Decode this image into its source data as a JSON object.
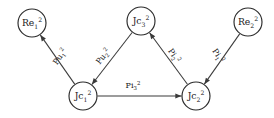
{
  "diagram": {
    "type": "directed-graph",
    "nodes": [
      {
        "id": "Re1",
        "base": "Re",
        "sub": "1",
        "sup": "2",
        "full": "Re₁²",
        "cx": 32,
        "cy": 23,
        "r": 14
      },
      {
        "id": "Jc3",
        "base": "Jc",
        "sub": "3",
        "sup": "2",
        "full": "Jc₃²",
        "cx": 141,
        "cy": 21,
        "r": 14
      },
      {
        "id": "Re2",
        "base": "Re",
        "sub": "2",
        "sup": "2",
        "full": "Re₂²",
        "cx": 248,
        "cy": 22,
        "r": 14
      },
      {
        "id": "Jc1",
        "base": "Jc",
        "sub": "1",
        "sup": "2",
        "full": "Jc₁²",
        "cx": 83,
        "cy": 96,
        "r": 14
      },
      {
        "id": "Jc2",
        "base": "Jc",
        "sub": "2",
        "sup": "2",
        "full": "Jc₂²",
        "cx": 196,
        "cy": 96,
        "r": 14
      }
    ],
    "edges": [
      {
        "id": "e1",
        "from": "Jc1",
        "to": "Re1",
        "base": "Pu",
        "sub": "1",
        "sup": "2",
        "full": "Pu₁²",
        "label_x": 62,
        "label_y": 58,
        "label_rotate": -55
      },
      {
        "id": "e2",
        "from": "Jc3",
        "to": "Jc1",
        "base": "Pu",
        "sub": "2",
        "sup": "2",
        "full": "Pu₂²",
        "label_x": 105,
        "label_y": 58,
        "label_rotate": -52
      },
      {
        "id": "e3",
        "from": "Jc2",
        "to": "Jc3",
        "base": "Pi",
        "sub": "2",
        "sup": "2",
        "full": "Pi₂²",
        "label_x": 172,
        "label_y": 57,
        "label_rotate": 56
      },
      {
        "id": "e4",
        "from": "Re2",
        "to": "Jc2",
        "base": "Pi",
        "sub": "1",
        "sup": "2",
        "full": "Pi₁²",
        "label_x": 216,
        "label_y": 57,
        "label_rotate": 57
      },
      {
        "id": "e5",
        "from": "Jc1",
        "to": "Jc2",
        "base": "Pi",
        "sub": "3",
        "sup": "2",
        "full": "Pi₃²",
        "label_x": 133,
        "label_y": 88,
        "label_rotate": 0
      }
    ],
    "colors": {
      "node_stroke": "#2a2a2a",
      "node_fill": "#ffffff",
      "edge_stroke": "#3a3a3a",
      "text": "#1a1a1a",
      "background": "#ffffff"
    }
  }
}
